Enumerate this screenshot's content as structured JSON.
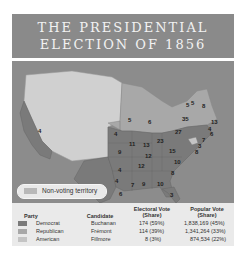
{
  "title": {
    "line1": "THE PRESIDENTIAL",
    "line2": "ELECTION OF 1856"
  },
  "map": {
    "colors": {
      "democrat": "#7a7a7a",
      "republican": "#a8a8a8",
      "american": "#c4c4c4",
      "territory": "#d0d0d0",
      "water": "#8c8c8c"
    },
    "state_labels": [
      {
        "v": "4",
        "x": 26,
        "y": 67
      },
      {
        "v": "4",
        "x": 103,
        "y": 117
      },
      {
        "v": "5",
        "x": 116,
        "y": 56
      },
      {
        "v": "6",
        "x": 136,
        "y": 58
      },
      {
        "v": "4",
        "x": 102,
        "y": 70
      },
      {
        "v": "11",
        "x": 117,
        "y": 80
      },
      {
        "v": "13",
        "x": 131,
        "y": 81
      },
      {
        "v": "23",
        "x": 145,
        "y": 77
      },
      {
        "v": "27",
        "x": 163,
        "y": 68
      },
      {
        "v": "35",
        "x": 170,
        "y": 55
      },
      {
        "v": "5",
        "x": 174,
        "y": 41
      },
      {
        "v": "5",
        "x": 179,
        "y": 39
      },
      {
        "v": "8",
        "x": 190,
        "y": 42
      },
      {
        "v": "13",
        "x": 199,
        "y": 58
      },
      {
        "v": "4",
        "x": 196,
        "y": 65
      },
      {
        "v": "6",
        "x": 198,
        "y": 70
      },
      {
        "v": "7",
        "x": 190,
        "y": 76
      },
      {
        "v": "3",
        "x": 186,
        "y": 82
      },
      {
        "v": "8",
        "x": 183,
        "y": 88
      },
      {
        "v": "9",
        "x": 106,
        "y": 88
      },
      {
        "v": "12",
        "x": 133,
        "y": 92
      },
      {
        "v": "15",
        "x": 157,
        "y": 87
      },
      {
        "v": "10",
        "x": 162,
        "y": 98
      },
      {
        "v": "12",
        "x": 126,
        "y": 102
      },
      {
        "v": "4",
        "x": 106,
        "y": 106
      },
      {
        "v": "8",
        "x": 159,
        "y": 109
      },
      {
        "v": "7",
        "x": 119,
        "y": 121
      },
      {
        "v": "9",
        "x": 130,
        "y": 120
      },
      {
        "v": "10",
        "x": 145,
        "y": 120
      },
      {
        "v": "6",
        "x": 107,
        "y": 130
      },
      {
        "v": "3",
        "x": 158,
        "y": 131
      }
    ],
    "legend": {
      "label": "Non-voting territory"
    }
  },
  "table": {
    "headers": {
      "party": "Party",
      "candidate": "Candidate",
      "electoral": "Electoral Vote (Share)",
      "popular": "Popular Vote (Share)"
    },
    "rows": [
      {
        "party": "Democrat",
        "candidate": "Buchanan",
        "electoral": "174 (59%)",
        "popular": "1,838,169 (45%)",
        "color": "#7a7a7a"
      },
      {
        "party": "Republican",
        "candidate": "Frémont",
        "electoral": "114 (39%)",
        "popular": "1,341,264 (33%)",
        "color": "#a8a8a8"
      },
      {
        "party": "American",
        "candidate": "Fillmore",
        "electoral": "8 (3%)",
        "popular": "874,534 (22%)",
        "color": "#c4c4c4"
      }
    ]
  }
}
